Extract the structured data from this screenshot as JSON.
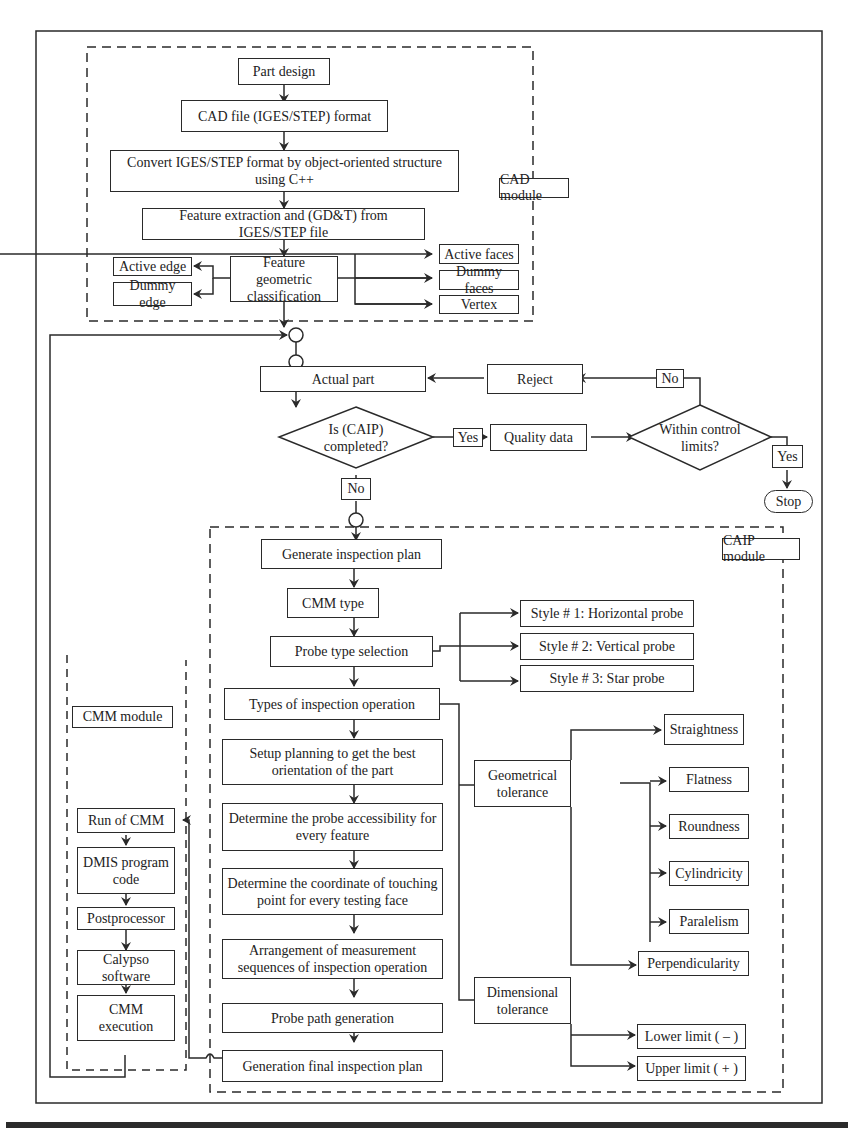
{
  "colors": {
    "line": "#2a2a2a",
    "background": "#ffffff",
    "text": "#222222"
  },
  "modules": {
    "cad": "CAD module",
    "caip": "CAIP module",
    "cmm": "CMM module"
  },
  "cad_module": {
    "part_design": "Part design",
    "cad_file": "CAD file (IGES/STEP) format",
    "convert": "Convert IGES/STEP format by object-oriented structure using C++",
    "feature_extraction": "Feature extraction and  (GD&T) from IGES/STEP file",
    "feature_classification": "Feature geometric classification",
    "active_edge": "Active edge",
    "dummy_edge": "Dummy edge",
    "active_faces": "Active faces",
    "dummy_faces": "Dummy faces",
    "vertex": "Vertex"
  },
  "decision_flow": {
    "actual_part": "Actual part",
    "reject": "Reject",
    "caip_completed": "Is (CAIP) completed?",
    "quality_data": "Quality data",
    "within_limits": "Within control limits?",
    "yes_1": "Yes",
    "no_1": "No",
    "no_2": "No",
    "yes_2": "Yes",
    "stop": "Stop"
  },
  "caip_module": {
    "generate_plan": "Generate inspection plan",
    "cmm_type": "CMM type",
    "probe_type": "Probe type selection",
    "style1": "Style # 1: Horizontal probe",
    "style2": "Style # 2: Vertical probe",
    "style3": "Style # 3: Star probe",
    "types_operation": "Types of inspection operation",
    "setup_planning": "Setup planning to get the best orientation of the part",
    "probe_accessibility": "Determine the probe accessibility for every feature",
    "touching_point": "Determine the coordinate of touching point for every testing face",
    "arrangement": "Arrangement of measurement sequences of inspection operation",
    "probe_path": "Probe path generation",
    "final_plan": "Generation final inspection plan",
    "geometrical_tolerance": "Geometrical tolerance",
    "straightness": "Straightness",
    "flatness": "Flatness",
    "roundness": "Roundness",
    "cylindricity": "Cylindricity",
    "paralelism": "Paralelism",
    "perpendicularity": "Perpendicularity",
    "dimensional_tolerance": "Dimensional tolerance",
    "lower_limit": "Lower limit ( – )",
    "upper_limit": "Upper limit ( + )"
  },
  "cmm_module": {
    "run_cmm": "Run of CMM",
    "dmis": "DMIS program code",
    "postprocessor": "Postprocessor",
    "calypso": "Calypso software",
    "execution": "CMM execution"
  }
}
